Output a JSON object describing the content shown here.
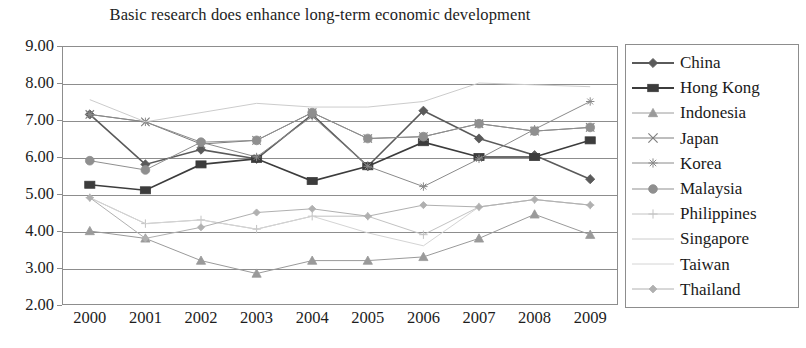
{
  "chart_data": {
    "type": "line",
    "title": "Basic research does enhance long-term economic development",
    "xlabel": "",
    "ylabel": "",
    "x": [
      "2000",
      "2001",
      "2002",
      "2003",
      "2004",
      "2005",
      "2006",
      "2007",
      "2008",
      "2009"
    ],
    "categories": [
      "2000",
      "2001",
      "2002",
      "2003",
      "2004",
      "2005",
      "2006",
      "2007",
      "2008",
      "2009"
    ],
    "ylim": [
      2.0,
      9.0
    ],
    "yticks": [
      "9.00",
      "8.00",
      "7.00",
      "6.00",
      "5.00",
      "4.00",
      "3.00",
      "2.00"
    ],
    "ytick_values": [
      9.0,
      8.0,
      7.0,
      6.0,
      5.0,
      4.0,
      3.0,
      2.0
    ],
    "grid": true,
    "legend_position": "right",
    "series": [
      {
        "name": "China",
        "marker": "diamond",
        "color": "#5a5a5a",
        "values": [
          7.15,
          5.8,
          6.2,
          5.95,
          7.15,
          5.75,
          7.25,
          6.5,
          6.05,
          5.4
        ]
      },
      {
        "name": "Hong Kong",
        "marker": "square",
        "color": "#3c3c3c",
        "values": [
          5.25,
          5.1,
          5.8,
          5.95,
          5.35,
          5.75,
          6.4,
          6.0,
          6.0,
          6.45
        ]
      },
      {
        "name": "Indonesia",
        "marker": "triangle",
        "color": "#9a9a9a",
        "values": [
          4.0,
          3.8,
          3.2,
          2.85,
          3.2,
          3.2,
          3.3,
          3.8,
          4.45,
          3.9
        ]
      },
      {
        "name": "Japan",
        "marker": "cross",
        "color": "#7c7c7c",
        "values": [
          7.15,
          6.95,
          6.35,
          6.45,
          7.2,
          6.5,
          6.55,
          6.9,
          6.7,
          6.8
        ]
      },
      {
        "name": "Korea",
        "marker": "star",
        "color": "#8a8a8a",
        "values": [
          7.15,
          6.95,
          6.4,
          6.0,
          7.1,
          5.75,
          5.2,
          5.95,
          6.75,
          7.5
        ]
      },
      {
        "name": "Malaysia",
        "marker": "circle",
        "color": "#8f8f8f",
        "values": [
          5.9,
          5.65,
          6.4,
          6.45,
          7.2,
          6.5,
          6.55,
          6.9,
          6.7,
          6.8
        ]
      },
      {
        "name": "Philippines",
        "marker": "plus",
        "color": "#c2c2c2",
        "values": [
          4.9,
          4.2,
          4.3,
          4.05,
          4.4,
          4.4,
          3.9,
          4.65,
          4.85,
          4.7
        ]
      },
      {
        "name": "Singapore",
        "marker": "line",
        "color": "#cccccc",
        "values": [
          7.55,
          6.95,
          7.2,
          7.45,
          7.35,
          7.35,
          7.5,
          8.0,
          7.95,
          7.9
        ]
      },
      {
        "name": "Taiwan",
        "marker": "line",
        "color": "#d4d4d4",
        "values": [
          4.9,
          4.2,
          4.3,
          4.05,
          4.4,
          3.95,
          3.6,
          4.65,
          4.85,
          4.7
        ]
      },
      {
        "name": "Thailand",
        "marker": "diamond-small",
        "color": "#b0b0b0",
        "values": [
          4.9,
          3.8,
          4.1,
          4.5,
          4.6,
          4.4,
          4.7,
          4.65,
          4.85,
          4.7
        ]
      }
    ]
  },
  "legend": {
    "items": [
      {
        "label": "China"
      },
      {
        "label": "Hong Kong"
      },
      {
        "label": "Indonesia"
      },
      {
        "label": "Japan"
      },
      {
        "label": "Korea"
      },
      {
        "label": "Malaysia"
      },
      {
        "label": "Philippines"
      },
      {
        "label": "Singapore"
      },
      {
        "label": "Taiwan"
      },
      {
        "label": "Thailand"
      }
    ]
  }
}
